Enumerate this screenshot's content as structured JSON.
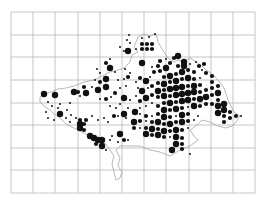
{
  "map": {
    "title": "",
    "grid": {
      "x_lines": [
        11,
        33,
        55,
        78,
        100,
        122,
        144,
        166,
        189,
        211,
        233,
        255
      ],
      "y_lines": [
        12,
        35,
        57,
        80,
        103,
        125,
        148,
        170,
        193
      ],
      "color": "#b8b8b8"
    },
    "outline_color": "#9a9a9a",
    "dot_color": "#111111",
    "dot_sizes": {
      "large": 3.2,
      "medium": 2.1,
      "small": 1.0
    },
    "outline": "M40,97 L48,93 L58,89 L66,88 L74,86 L84,82 L94,80 L102,76 L110,72 L118,70 L124,68 L130,62 L132,55 L138,52 L134,47 L138,37 L144,34 L150,36 L156,34 L158,42 L164,52 L168,58 L174,62 L178,60 L184,62 L190,58 L196,62 L202,66 L206,70 L212,74 L218,80 L224,88 L228,100 L234,112 L240,116 L236,122 L232,126 L226,128 L218,126 L210,122 L202,120 L196,126 L190,130 L194,136 L198,140 L190,146 L180,150 L170,156 L160,152 L150,150 L140,146 L128,146 L120,146 L116,150 L120,158 L118,166 L122,172 L120,178 L116,180 L114,172 L112,164 L114,156 L110,150 L106,144 L98,140 L90,136 L82,132 L74,128 L66,124 L60,118 L54,114 L50,110 L44,106 L40,102 Z",
    "dots": [
      {
        "x": 44,
        "y": 94,
        "s": "large"
      },
      {
        "x": 55,
        "y": 95,
        "s": "large"
      },
      {
        "x": 48,
        "y": 102,
        "s": "small"
      },
      {
        "x": 52,
        "y": 106,
        "s": "small"
      },
      {
        "x": 58,
        "y": 108,
        "s": "small"
      },
      {
        "x": 60,
        "y": 104,
        "s": "small"
      },
      {
        "x": 60,
        "y": 114,
        "s": "large"
      },
      {
        "x": 67,
        "y": 110,
        "s": "small"
      },
      {
        "x": 70,
        "y": 103,
        "s": "small"
      },
      {
        "x": 71,
        "y": 115,
        "s": "small"
      },
      {
        "x": 74,
        "y": 92,
        "s": "large"
      },
      {
        "x": 78,
        "y": 92,
        "s": "medium"
      },
      {
        "x": 80,
        "y": 96,
        "s": "small"
      },
      {
        "x": 86,
        "y": 93,
        "s": "large"
      },
      {
        "x": 84,
        "y": 87,
        "s": "medium"
      },
      {
        "x": 92,
        "y": 87,
        "s": "small"
      },
      {
        "x": 98,
        "y": 90,
        "s": "large"
      },
      {
        "x": 100,
        "y": 82,
        "s": "medium"
      },
      {
        "x": 95,
        "y": 80,
        "s": "small"
      },
      {
        "x": 106,
        "y": 79,
        "s": "large"
      },
      {
        "x": 106,
        "y": 87,
        "s": "large"
      },
      {
        "x": 100,
        "y": 99,
        "s": "small"
      },
      {
        "x": 106,
        "y": 99,
        "s": "medium"
      },
      {
        "x": 111,
        "y": 97,
        "s": "small"
      },
      {
        "x": 115,
        "y": 93,
        "s": "medium"
      },
      {
        "x": 120,
        "y": 88,
        "s": "small"
      },
      {
        "x": 118,
        "y": 80,
        "s": "small"
      },
      {
        "x": 126,
        "y": 86,
        "s": "small"
      },
      {
        "x": 97,
        "y": 69,
        "s": "small"
      },
      {
        "x": 100,
        "y": 73,
        "s": "small"
      },
      {
        "x": 110,
        "y": 68,
        "s": "large"
      },
      {
        "x": 106,
        "y": 63,
        "s": "medium"
      },
      {
        "x": 110,
        "y": 59,
        "s": "small"
      },
      {
        "x": 115,
        "y": 72,
        "s": "small"
      },
      {
        "x": 125,
        "y": 69,
        "s": "small"
      },
      {
        "x": 128,
        "y": 77,
        "s": "medium"
      },
      {
        "x": 124,
        "y": 79,
        "s": "small"
      },
      {
        "x": 130,
        "y": 73,
        "s": "small"
      },
      {
        "x": 128,
        "y": 51,
        "s": "large"
      },
      {
        "x": 130,
        "y": 43,
        "s": "small"
      },
      {
        "x": 124,
        "y": 51,
        "s": "small"
      },
      {
        "x": 120,
        "y": 47,
        "s": "small"
      },
      {
        "x": 127,
        "y": 40,
        "s": "small"
      },
      {
        "x": 129,
        "y": 35,
        "s": "small"
      },
      {
        "x": 136,
        "y": 49,
        "s": "small"
      },
      {
        "x": 140,
        "y": 63,
        "s": "small"
      },
      {
        "x": 142,
        "y": 38,
        "s": "small"
      },
      {
        "x": 142,
        "y": 44,
        "s": "medium"
      },
      {
        "x": 147,
        "y": 44,
        "s": "medium"
      },
      {
        "x": 152,
        "y": 44,
        "s": "medium"
      },
      {
        "x": 142,
        "y": 49,
        "s": "medium"
      },
      {
        "x": 147,
        "y": 49,
        "s": "medium"
      },
      {
        "x": 152,
        "y": 49,
        "s": "medium"
      },
      {
        "x": 149,
        "y": 37,
        "s": "small"
      },
      {
        "x": 155,
        "y": 34,
        "s": "small"
      },
      {
        "x": 142,
        "y": 63,
        "s": "large"
      },
      {
        "x": 152,
        "y": 67,
        "s": "small"
      },
      {
        "x": 158,
        "y": 66,
        "s": "medium"
      },
      {
        "x": 160,
        "y": 61,
        "s": "medium"
      },
      {
        "x": 154,
        "y": 72,
        "s": "medium"
      },
      {
        "x": 160,
        "y": 71,
        "s": "medium"
      },
      {
        "x": 166,
        "y": 68,
        "s": "large"
      },
      {
        "x": 170,
        "y": 63,
        "s": "medium"
      },
      {
        "x": 174,
        "y": 58,
        "s": "medium"
      },
      {
        "x": 166,
        "y": 59,
        "s": "small"
      },
      {
        "x": 178,
        "y": 56,
        "s": "large"
      },
      {
        "x": 184,
        "y": 62,
        "s": "large"
      },
      {
        "x": 178,
        "y": 66,
        "s": "medium"
      },
      {
        "x": 184,
        "y": 66,
        "s": "large"
      },
      {
        "x": 190,
        "y": 64,
        "s": "small"
      },
      {
        "x": 196,
        "y": 62,
        "s": "small"
      },
      {
        "x": 199,
        "y": 66,
        "s": "medium"
      },
      {
        "x": 204,
        "y": 64,
        "s": "medium"
      },
      {
        "x": 202,
        "y": 70,
        "s": "small"
      },
      {
        "x": 206,
        "y": 73,
        "s": "medium"
      },
      {
        "x": 136,
        "y": 82,
        "s": "small"
      },
      {
        "x": 140,
        "y": 78,
        "s": "medium"
      },
      {
        "x": 146,
        "y": 81,
        "s": "large"
      },
      {
        "x": 150,
        "y": 77,
        "s": "small"
      },
      {
        "x": 138,
        "y": 88,
        "s": "small"
      },
      {
        "x": 142,
        "y": 91,
        "s": "large"
      },
      {
        "x": 148,
        "y": 88,
        "s": "small"
      },
      {
        "x": 152,
        "y": 86,
        "s": "medium"
      },
      {
        "x": 136,
        "y": 96,
        "s": "small"
      },
      {
        "x": 140,
        "y": 101,
        "s": "medium"
      },
      {
        "x": 146,
        "y": 98,
        "s": "large"
      },
      {
        "x": 152,
        "y": 95,
        "s": "medium"
      },
      {
        "x": 158,
        "y": 83,
        "s": "medium"
      },
      {
        "x": 158,
        "y": 91,
        "s": "large"
      },
      {
        "x": 158,
        "y": 97,
        "s": "medium"
      },
      {
        "x": 164,
        "y": 77,
        "s": "medium"
      },
      {
        "x": 170,
        "y": 76,
        "s": "large"
      },
      {
        "x": 176,
        "y": 74,
        "s": "medium"
      },
      {
        "x": 182,
        "y": 72,
        "s": "large"
      },
      {
        "x": 188,
        "y": 70,
        "s": "medium"
      },
      {
        "x": 194,
        "y": 72,
        "s": "medium"
      },
      {
        "x": 164,
        "y": 84,
        "s": "large"
      },
      {
        "x": 170,
        "y": 82,
        "s": "medium"
      },
      {
        "x": 176,
        "y": 81,
        "s": "large"
      },
      {
        "x": 182,
        "y": 79,
        "s": "medium"
      },
      {
        "x": 188,
        "y": 78,
        "s": "large"
      },
      {
        "x": 194,
        "y": 79,
        "s": "medium"
      },
      {
        "x": 200,
        "y": 78,
        "s": "small"
      },
      {
        "x": 164,
        "y": 90,
        "s": "medium"
      },
      {
        "x": 170,
        "y": 89,
        "s": "large"
      },
      {
        "x": 176,
        "y": 88,
        "s": "large"
      },
      {
        "x": 182,
        "y": 87,
        "s": "large"
      },
      {
        "x": 188,
        "y": 86,
        "s": "medium"
      },
      {
        "x": 194,
        "y": 86,
        "s": "large"
      },
      {
        "x": 200,
        "y": 85,
        "s": "medium"
      },
      {
        "x": 164,
        "y": 96,
        "s": "large"
      },
      {
        "x": 170,
        "y": 96,
        "s": "medium"
      },
      {
        "x": 176,
        "y": 95,
        "s": "large"
      },
      {
        "x": 182,
        "y": 94,
        "s": "large"
      },
      {
        "x": 188,
        "y": 93,
        "s": "large"
      },
      {
        "x": 194,
        "y": 92,
        "s": "large"
      },
      {
        "x": 200,
        "y": 92,
        "s": "medium"
      },
      {
        "x": 206,
        "y": 90,
        "s": "medium"
      },
      {
        "x": 212,
        "y": 88,
        "s": "medium"
      },
      {
        "x": 212,
        "y": 82,
        "s": "medium"
      },
      {
        "x": 212,
        "y": 76,
        "s": "medium"
      },
      {
        "x": 218,
        "y": 86,
        "s": "medium"
      },
      {
        "x": 164,
        "y": 103,
        "s": "medium"
      },
      {
        "x": 170,
        "y": 103,
        "s": "large"
      },
      {
        "x": 176,
        "y": 102,
        "s": "medium"
      },
      {
        "x": 182,
        "y": 101,
        "s": "large"
      },
      {
        "x": 188,
        "y": 100,
        "s": "large"
      },
      {
        "x": 194,
        "y": 99,
        "s": "medium"
      },
      {
        "x": 200,
        "y": 99,
        "s": "large"
      },
      {
        "x": 206,
        "y": 97,
        "s": "large"
      },
      {
        "x": 212,
        "y": 95,
        "s": "medium"
      },
      {
        "x": 218,
        "y": 93,
        "s": "large"
      },
      {
        "x": 218,
        "y": 100,
        "s": "medium"
      },
      {
        "x": 218,
        "y": 106,
        "s": "large"
      },
      {
        "x": 212,
        "y": 104,
        "s": "medium"
      },
      {
        "x": 206,
        "y": 104,
        "s": "medium"
      },
      {
        "x": 224,
        "y": 104,
        "s": "large"
      },
      {
        "x": 224,
        "y": 110,
        "s": "large"
      },
      {
        "x": 230,
        "y": 112,
        "s": "medium"
      },
      {
        "x": 224,
        "y": 116,
        "s": "medium"
      },
      {
        "x": 218,
        "y": 113,
        "s": "large"
      },
      {
        "x": 230,
        "y": 118,
        "s": "medium"
      },
      {
        "x": 236,
        "y": 116,
        "s": "medium"
      },
      {
        "x": 241,
        "y": 116,
        "s": "small"
      },
      {
        "x": 224,
        "y": 122,
        "s": "medium"
      },
      {
        "x": 158,
        "y": 106,
        "s": "medium"
      },
      {
        "x": 152,
        "y": 103,
        "s": "small"
      },
      {
        "x": 146,
        "y": 106,
        "s": "small"
      },
      {
        "x": 140,
        "y": 108,
        "s": "small"
      },
      {
        "x": 164,
        "y": 110,
        "s": "large"
      },
      {
        "x": 170,
        "y": 110,
        "s": "medium"
      },
      {
        "x": 176,
        "y": 109,
        "s": "large"
      },
      {
        "x": 182,
        "y": 108,
        "s": "medium"
      },
      {
        "x": 188,
        "y": 107,
        "s": "small"
      },
      {
        "x": 194,
        "y": 106,
        "s": "large"
      },
      {
        "x": 200,
        "y": 106,
        "s": "medium"
      },
      {
        "x": 135,
        "y": 112,
        "s": "large"
      },
      {
        "x": 140,
        "y": 114,
        "s": "small"
      },
      {
        "x": 146,
        "y": 116,
        "s": "medium"
      },
      {
        "x": 152,
        "y": 116,
        "s": "small"
      },
      {
        "x": 158,
        "y": 114,
        "s": "medium"
      },
      {
        "x": 164,
        "y": 117,
        "s": "large"
      },
      {
        "x": 170,
        "y": 117,
        "s": "medium"
      },
      {
        "x": 176,
        "y": 116,
        "s": "small"
      },
      {
        "x": 182,
        "y": 115,
        "s": "large"
      },
      {
        "x": 188,
        "y": 114,
        "s": "medium"
      },
      {
        "x": 134,
        "y": 122,
        "s": "large"
      },
      {
        "x": 140,
        "y": 121,
        "s": "medium"
      },
      {
        "x": 146,
        "y": 121,
        "s": "small"
      },
      {
        "x": 152,
        "y": 122,
        "s": "medium"
      },
      {
        "x": 158,
        "y": 122,
        "s": "large"
      },
      {
        "x": 164,
        "y": 124,
        "s": "medium"
      },
      {
        "x": 170,
        "y": 124,
        "s": "large"
      },
      {
        "x": 176,
        "y": 122,
        "s": "medium"
      },
      {
        "x": 182,
        "y": 122,
        "s": "large"
      },
      {
        "x": 188,
        "y": 121,
        "s": "medium"
      },
      {
        "x": 134,
        "y": 128,
        "s": "medium"
      },
      {
        "x": 140,
        "y": 128,
        "s": "small"
      },
      {
        "x": 146,
        "y": 128,
        "s": "medium"
      },
      {
        "x": 152,
        "y": 129,
        "s": "large"
      },
      {
        "x": 158,
        "y": 129,
        "s": "medium"
      },
      {
        "x": 164,
        "y": 131,
        "s": "large"
      },
      {
        "x": 170,
        "y": 131,
        "s": "medium"
      },
      {
        "x": 176,
        "y": 130,
        "s": "large"
      },
      {
        "x": 182,
        "y": 130,
        "s": "medium"
      },
      {
        "x": 188,
        "y": 128,
        "s": "small"
      },
      {
        "x": 146,
        "y": 134,
        "s": "large"
      },
      {
        "x": 152,
        "y": 135,
        "s": "medium"
      },
      {
        "x": 158,
        "y": 135,
        "s": "large"
      },
      {
        "x": 164,
        "y": 137,
        "s": "medium"
      },
      {
        "x": 170,
        "y": 137,
        "s": "small"
      },
      {
        "x": 176,
        "y": 137,
        "s": "large"
      },
      {
        "x": 182,
        "y": 138,
        "s": "medium"
      },
      {
        "x": 176,
        "y": 144,
        "s": "large"
      },
      {
        "x": 182,
        "y": 144,
        "s": "medium"
      },
      {
        "x": 172,
        "y": 150,
        "s": "large"
      },
      {
        "x": 182,
        "y": 149,
        "s": "medium"
      },
      {
        "x": 190,
        "y": 154,
        "s": "small"
      },
      {
        "x": 194,
        "y": 120,
        "s": "small"
      },
      {
        "x": 198,
        "y": 116,
        "s": "small"
      },
      {
        "x": 110,
        "y": 106,
        "s": "small"
      },
      {
        "x": 116,
        "y": 108,
        "s": "small"
      },
      {
        "x": 120,
        "y": 104,
        "s": "small"
      },
      {
        "x": 124,
        "y": 98,
        "s": "large"
      },
      {
        "x": 130,
        "y": 100,
        "s": "small"
      },
      {
        "x": 114,
        "y": 116,
        "s": "medium"
      },
      {
        "x": 118,
        "y": 116,
        "s": "small"
      },
      {
        "x": 124,
        "y": 114,
        "s": "large"
      },
      {
        "x": 126,
        "y": 118,
        "s": "small"
      },
      {
        "x": 128,
        "y": 108,
        "s": "small"
      },
      {
        "x": 80,
        "y": 124,
        "s": "large"
      },
      {
        "x": 84,
        "y": 124,
        "s": "medium"
      },
      {
        "x": 80,
        "y": 128,
        "s": "large"
      },
      {
        "x": 84,
        "y": 130,
        "s": "medium"
      },
      {
        "x": 80,
        "y": 120,
        "s": "medium"
      },
      {
        "x": 86,
        "y": 120,
        "s": "medium"
      },
      {
        "x": 90,
        "y": 136,
        "s": "large"
      },
      {
        "x": 94,
        "y": 138,
        "s": "large"
      },
      {
        "x": 98,
        "y": 140,
        "s": "large"
      },
      {
        "x": 102,
        "y": 140,
        "s": "large"
      },
      {
        "x": 96,
        "y": 144,
        "s": "medium"
      },
      {
        "x": 102,
        "y": 146,
        "s": "large"
      },
      {
        "x": 106,
        "y": 150,
        "s": "small"
      },
      {
        "x": 110,
        "y": 140,
        "s": "small"
      },
      {
        "x": 120,
        "y": 134,
        "s": "large"
      },
      {
        "x": 124,
        "y": 140,
        "s": "medium"
      },
      {
        "x": 128,
        "y": 140,
        "s": "small"
      },
      {
        "x": 118,
        "y": 142,
        "s": "small"
      },
      {
        "x": 112,
        "y": 136,
        "s": "small"
      },
      {
        "x": 98,
        "y": 120,
        "s": "small"
      },
      {
        "x": 104,
        "y": 118,
        "s": "small"
      },
      {
        "x": 108,
        "y": 122,
        "s": "small"
      },
      {
        "x": 92,
        "y": 116,
        "s": "small"
      },
      {
        "x": 70,
        "y": 122,
        "s": "small"
      },
      {
        "x": 66,
        "y": 118,
        "s": "small"
      },
      {
        "x": 76,
        "y": 118,
        "s": "small"
      },
      {
        "x": 48,
        "y": 118,
        "s": "small"
      },
      {
        "x": 46,
        "y": 112,
        "s": "small"
      },
      {
        "x": 54,
        "y": 120,
        "s": "small"
      }
    ]
  }
}
